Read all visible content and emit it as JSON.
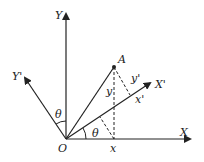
{
  "diagram": {
    "labels": {
      "origin": "O",
      "axis_x": "X",
      "axis_y": "Y",
      "axis_x_prime": "X'",
      "axis_y_prime": "Y'",
      "point": "A",
      "theta_top": "θ",
      "theta_bottom": "θ",
      "coord_x": "x",
      "coord_y": "y",
      "coord_x_prime": "x'",
      "coord_y_prime": "y'"
    },
    "colors": {
      "stroke": "#222222",
      "background": "#ffffff"
    }
  }
}
